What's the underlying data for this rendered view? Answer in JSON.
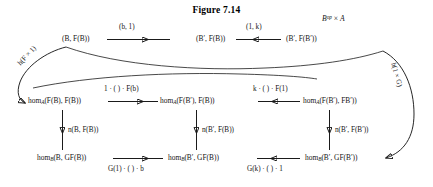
{
  "figure": {
    "title": "Figure 7.14",
    "corner_label": "B^op × A"
  },
  "top_row": {
    "nodes": [
      {
        "id": "t1",
        "text": "(B, F(B))"
      },
      {
        "id": "t2",
        "text": "(B′, F(B))"
      },
      {
        "id": "t3",
        "text": "(B′, F(B′))"
      }
    ],
    "arrows": [
      {
        "id": "t-a1",
        "label": "(b, 1)",
        "direction": "right"
      },
      {
        "id": "t-a2",
        "label": "(1, k)",
        "direction": "left"
      }
    ]
  },
  "middle_row": {
    "nodes": [
      {
        "id": "m1",
        "text": "hom",
        "sub": "A",
        "rest": "(F(B), F(B))"
      },
      {
        "id": "m2",
        "text": "hom",
        "sub": "A",
        "rest": "(F(B′), F(B))"
      },
      {
        "id": "m3",
        "text": "hom",
        "sub": "A",
        "rest": "(F(B′), FB′))"
      }
    ],
    "arrows": [
      {
        "id": "m-a1",
        "label": "1 · ( ) · F(b)",
        "direction": "right"
      },
      {
        "id": "m-a2",
        "label": "k · ( ) · F(1)",
        "direction": "left"
      }
    ]
  },
  "bottom_row": {
    "nodes": [
      {
        "id": "b1",
        "text": "hom",
        "sub": "B",
        "rest": "(B, GF(B))"
      },
      {
        "id": "b2",
        "text": "hom",
        "sub": "B",
        "rest": "(B′, GF(B))"
      },
      {
        "id": "b3",
        "text": "hom",
        "sub": "B",
        "rest": "(B′, GF(B′))"
      }
    ],
    "arrows": [
      {
        "id": "b-a1",
        "label": "G(1) · ( ) · b",
        "direction": "right"
      },
      {
        "id": "b-a2",
        "label": "G(k) · ( ) · 1",
        "direction": "left"
      }
    ]
  },
  "vertical_arrows": [
    {
      "id": "v1",
      "label": "n(B, F(B))"
    },
    {
      "id": "v2",
      "label": "n(B′, F(B))"
    },
    {
      "id": "v3",
      "label": "n(B′, F(B′))"
    }
  ],
  "curved_arrows": [
    {
      "id": "c-left",
      "label": "h(F × 1)"
    },
    {
      "id": "c-right",
      "label": "h(1 × G)"
    }
  ],
  "colors": {
    "ink": "#1a1a1a",
    "background": "#ffffff"
  }
}
